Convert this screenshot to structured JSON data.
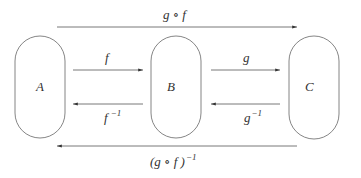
{
  "nodes": {
    "a": "A",
    "b": "B",
    "c": "C"
  },
  "arrows": {
    "f": "f",
    "f_inv_base": "f",
    "f_inv_sup": "−1",
    "g": "g",
    "g_inv_base": "g",
    "g_inv_sup": "−1",
    "gof": "g ∘ f",
    "gof_inv_base": "(g ∘ f )",
    "gof_inv_sup": "−1"
  },
  "colors": {
    "stroke": "#555555",
    "text": "#333333"
  }
}
